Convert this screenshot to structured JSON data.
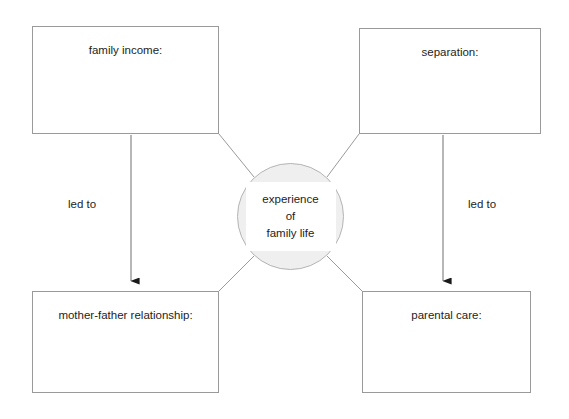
{
  "diagram": {
    "type": "spider-diagram",
    "background_color": "#ffffff",
    "box_border_color": "#9a9a9a",
    "circle_fill_color": "#efeff0",
    "circle_border_color": "#b4b4b4",
    "connector_color": "#9a9a9a",
    "arrow_color": "#6e6e6e",
    "arrowhead_color": "#1a1a1a",
    "text_color": "#1d1d1d"
  },
  "center": {
    "line1": "experience",
    "line2": "of",
    "line3": "family life"
  },
  "boxes": [
    {
      "id": "family-income",
      "label": "family income:"
    },
    {
      "id": "separation",
      "label": "separation:"
    },
    {
      "id": "mother-father-relationship",
      "label": "mother-father relationship:"
    },
    {
      "id": "parental-care",
      "label": "parental care:"
    }
  ],
  "edge_labels": [
    {
      "id": "left",
      "label": "led to"
    },
    {
      "id": "right",
      "label": "led to"
    }
  ]
}
